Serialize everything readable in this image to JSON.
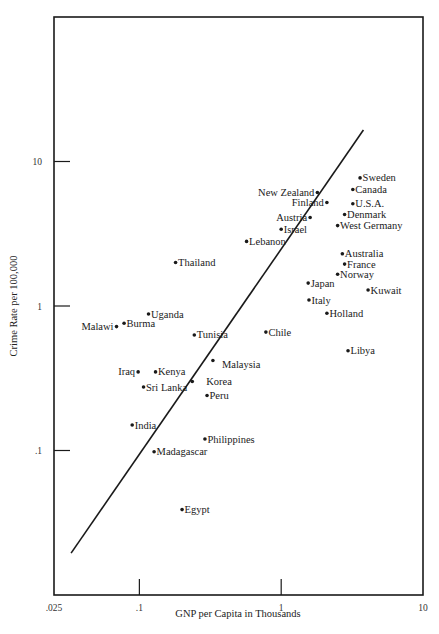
{
  "chart_data": {
    "type": "scatter",
    "title": "",
    "xlabel": "GNP per Capita in Thousands",
    "ylabel": "Crime Rate per 100,000",
    "x_scale": "log",
    "y_scale": "log",
    "xlim": [
      0.025,
      10
    ],
    "ylim": [
      0.01,
      100
    ],
    "x_ticks": [
      {
        "value": 0.025,
        "label": ".025"
      },
      {
        "value": 0.1,
        "label": ".1"
      },
      {
        "value": 1,
        "label": "1"
      },
      {
        "value": 10,
        "label": "10"
      }
    ],
    "y_ticks": [
      {
        "value": 0.1,
        "label": ".1"
      },
      {
        "value": 1,
        "label": "1"
      },
      {
        "value": 10,
        "label": "10"
      }
    ],
    "grid": false,
    "legend": null,
    "regression_line": {
      "start": {
        "x": 0.033,
        "y": 0.0195
      },
      "end": {
        "x": 3.8,
        "y": 16.5
      }
    },
    "points": [
      {
        "label": "Sweden",
        "x": 3.6,
        "y": 7.7,
        "label_side": "right"
      },
      {
        "label": "Canada",
        "x": 3.2,
        "y": 6.4,
        "label_side": "right"
      },
      {
        "label": "New Zealand",
        "x": 1.8,
        "y": 6.1,
        "label_side": "left"
      },
      {
        "label": "Finland",
        "x": 2.1,
        "y": 5.2,
        "label_side": "left"
      },
      {
        "label": "U.S.A.",
        "x": 3.2,
        "y": 5.1,
        "label_side": "right"
      },
      {
        "label": "Denmark",
        "x": 2.8,
        "y": 4.3,
        "label_side": "right"
      },
      {
        "label": "Austria",
        "x": 1.6,
        "y": 4.1,
        "label_side": "left"
      },
      {
        "label": "West Germany",
        "x": 2.5,
        "y": 3.6,
        "label_side": "right"
      },
      {
        "label": "Israel",
        "x": 1.0,
        "y": 3.4,
        "label_side": "right"
      },
      {
        "label": "Lebanon",
        "x": 0.57,
        "y": 2.8,
        "label_side": "right"
      },
      {
        "label": "Thailand",
        "x": 0.18,
        "y": 2.0,
        "label_side": "right"
      },
      {
        "label": "Australia",
        "x": 2.7,
        "y": 2.3,
        "label_side": "right"
      },
      {
        "label": "France",
        "x": 2.8,
        "y": 1.95,
        "label_side": "right"
      },
      {
        "label": "Norway",
        "x": 2.5,
        "y": 1.66,
        "label_side": "right"
      },
      {
        "label": "Japan",
        "x": 1.55,
        "y": 1.44,
        "label_side": "right"
      },
      {
        "label": "Kuwait",
        "x": 4.1,
        "y": 1.29,
        "label_side": "right"
      },
      {
        "label": "Italy",
        "x": 1.57,
        "y": 1.1,
        "label_side": "right"
      },
      {
        "label": "Holland",
        "x": 2.1,
        "y": 0.89,
        "label_side": "right"
      },
      {
        "label": "Uganda",
        "x": 0.116,
        "y": 0.88,
        "label_side": "right"
      },
      {
        "label": "Burma",
        "x": 0.078,
        "y": 0.76,
        "label_side": "right"
      },
      {
        "label": "Malawi",
        "x": 0.069,
        "y": 0.72,
        "label_side": "left"
      },
      {
        "label": "Tunisia",
        "x": 0.244,
        "y": 0.63,
        "label_side": "right"
      },
      {
        "label": "Chile",
        "x": 0.78,
        "y": 0.66,
        "label_side": "right"
      },
      {
        "label": "Libya",
        "x": 2.96,
        "y": 0.49,
        "label_side": "right"
      },
      {
        "label": "Malaysia",
        "x": 0.33,
        "y": 0.42,
        "label_side": "right-below"
      },
      {
        "label": "Iraq",
        "x": 0.098,
        "y": 0.35,
        "label_side": "left"
      },
      {
        "label": "Kenya",
        "x": 0.13,
        "y": 0.35,
        "label_side": "right"
      },
      {
        "label": "Korea",
        "x": 0.236,
        "y": 0.3,
        "label_side": "right-gap"
      },
      {
        "label": "Sri Lanka",
        "x": 0.107,
        "y": 0.275,
        "label_side": "right"
      },
      {
        "label": "Peru",
        "x": 0.3,
        "y": 0.24,
        "label_side": "right"
      },
      {
        "label": "India",
        "x": 0.089,
        "y": 0.15,
        "label_side": "right"
      },
      {
        "label": "Philippines",
        "x": 0.29,
        "y": 0.12,
        "label_side": "right"
      },
      {
        "label": "Madagascar",
        "x": 0.127,
        "y": 0.098,
        "label_side": "right"
      },
      {
        "label": "Egypt",
        "x": 0.2,
        "y": 0.039,
        "label_side": "right"
      }
    ]
  },
  "colors": {
    "ink": "#1a1a1a",
    "background": "#ffffff"
  }
}
